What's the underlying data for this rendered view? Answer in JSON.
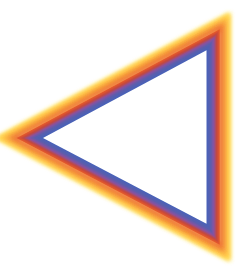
{
  "image": {
    "width": 237,
    "height": 267,
    "background_color": "#ffffff",
    "alt": "Triangle outline drawn with a blurred blue-to-yellow gradient stroke on a white background"
  },
  "caption_strip": {
    "description": "bottom sliver of a cropped line of text at the very top edge of the image",
    "visible_text": "",
    "ink_color": "#7a5a56",
    "smudges": [
      {
        "x": 6,
        "width": 5,
        "color": "#9a8f93"
      },
      {
        "x": 13,
        "width": 4,
        "color": "#a0959a"
      },
      {
        "x": 19,
        "width": 3,
        "color": "#b9abb0"
      },
      {
        "x": 24,
        "width": 6,
        "color": "#8a5f5c"
      },
      {
        "x": 32,
        "width": 4,
        "color": "#7a5a56"
      },
      {
        "x": 38,
        "width": 5,
        "color": "#b0a5a8"
      },
      {
        "x": 45,
        "width": 4,
        "color": "#c2b8ba"
      },
      {
        "x": 51,
        "width": 6,
        "color": "#bdb2b5"
      },
      {
        "x": 59,
        "width": 4,
        "color": "#cac2c4"
      },
      {
        "x": 126,
        "width": 3,
        "color": "#c0b6b9"
      },
      {
        "x": 131,
        "width": 3,
        "color": "#c8c0c2"
      },
      {
        "x": 152,
        "width": 4,
        "color": "#beb4b7"
      },
      {
        "x": 158,
        "width": 5,
        "color": "#c6bdbf"
      },
      {
        "x": 165,
        "width": 3,
        "color": "#cdc5c7"
      }
    ]
  },
  "figure": {
    "type": "polygon-outline",
    "shape_name": "triangle",
    "orientation": "apex pointing left",
    "fill": "none",
    "interior_color": "#ffffff",
    "vertices": [
      {
        "name": "left-apex",
        "x": 20,
        "y": 138
      },
      {
        "name": "top-right-corner",
        "x": 218,
        "y": 32
      },
      {
        "name": "bottom-right-corner",
        "x": 218,
        "y": 242
      }
    ],
    "stroke": {
      "total_width_px": 22,
      "inner_edge": "crisp",
      "outer_edge": "soft glow falloff",
      "blur_radius_px": 3,
      "direction": "inner edge blue, outer edge yellow",
      "color_stops": [
        {
          "offset": 0.0,
          "color": "#4a63b8",
          "name": "blue"
        },
        {
          "offset": 0.16,
          "color": "#5a5fae",
          "name": "indigo"
        },
        {
          "offset": 0.3,
          "color": "#8a52a0",
          "name": "violet"
        },
        {
          "offset": 0.42,
          "color": "#c4483f",
          "name": "crimson"
        },
        {
          "offset": 0.55,
          "color": "#e85c2a",
          "name": "red-orange"
        },
        {
          "offset": 0.7,
          "color": "#f5913a",
          "name": "orange"
        },
        {
          "offset": 0.84,
          "color": "#fdc040",
          "name": "amber"
        },
        {
          "offset": 1.0,
          "color": "#ffe04a",
          "name": "yellow"
        }
      ]
    }
  }
}
